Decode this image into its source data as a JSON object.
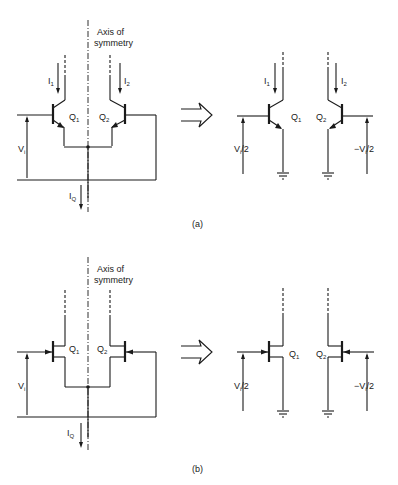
{
  "figure": {
    "panels": [
      {
        "id": "a",
        "caption": "(a)",
        "device_type": "BJT",
        "axis_label_line1": "Axis of",
        "axis_label_line2": "symmetry",
        "left_circuit": {
          "transistors": [
            "Q1",
            "Q2"
          ],
          "currents": [
            "I1",
            "I2",
            "IQ"
          ],
          "input_voltage": "Vi"
        },
        "right_circuit": {
          "transistors": [
            "Q1",
            "Q2"
          ],
          "currents": [
            "I1",
            "I2"
          ],
          "input_voltages": [
            "Vi/2",
            "-Vi/2"
          ]
        }
      },
      {
        "id": "b",
        "caption": "(b)",
        "device_type": "JFET",
        "axis_label_line1": "Axis of",
        "axis_label_line2": "symmetry",
        "left_circuit": {
          "transistors": [
            "Q1",
            "Q2"
          ],
          "currents": [
            "IQ"
          ],
          "input_voltage": "Vi"
        },
        "right_circuit": {
          "transistors": [
            "Q1",
            "Q2"
          ],
          "input_voltages": [
            "Vi/2",
            "-Vi/2"
          ]
        }
      }
    ]
  },
  "labels": {
    "a": {
      "axis1": "Axis of",
      "axis2": "symmetry",
      "I": "I",
      "one": "1",
      "two": "2",
      "Q": "Q",
      "V": "V",
      "i": "i",
      "half": "/2",
      "neg": "−V",
      "caption": "(a)"
    },
    "b": {
      "axis1": "Axis of",
      "axis2": "symmetry",
      "I": "I",
      "one": "1",
      "two": "2",
      "Q": "Q",
      "V": "V",
      "i": "i",
      "half": "/2",
      "neg": "−V",
      "caption": "(b)"
    }
  }
}
